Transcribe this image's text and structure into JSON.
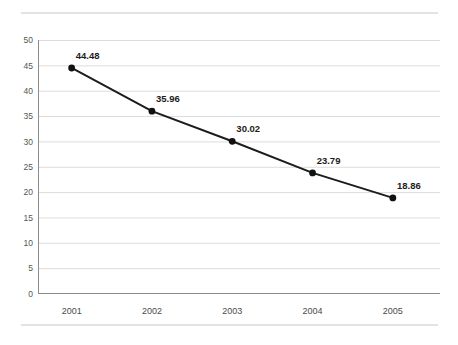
{
  "chart_data": {
    "type": "line",
    "title": "",
    "subtitle": "",
    "xlabel": "",
    "ylabel": "",
    "categories": [
      "2001",
      "2002",
      "2003",
      "2004",
      "2005"
    ],
    "values": [
      44.48,
      35.96,
      30.02,
      23.79,
      18.86
    ],
    "point_labels": [
      "44.48",
      "35.96",
      "30.02",
      "23.79",
      "18.86"
    ],
    "ylim": [
      0,
      50
    ],
    "ytick_labels": [
      "0",
      "5",
      "10",
      "15",
      "20",
      "25",
      "30",
      "35",
      "40",
      "45",
      "50"
    ],
    "ytick_values": [
      0,
      5,
      10,
      15,
      20,
      25,
      30,
      35,
      40,
      45,
      50
    ],
    "grid": "horizontal",
    "legend": "none",
    "series": [
      {
        "name": "",
        "values": [
          44.48,
          35.96,
          30.02,
          23.79,
          18.86
        ],
        "line_color": "#1c1c1c",
        "marker": "circle",
        "marker_color": "#111111"
      }
    ],
    "colors": {
      "line": "#1c1c1c",
      "marker": "#111111",
      "gridline": "#dcdcdc",
      "axis": "#8c8c8c",
      "label_text": "#1c1c1c",
      "tick_text": "#555555",
      "background": "#ffffff",
      "rule": "#e3e3e3"
    }
  }
}
